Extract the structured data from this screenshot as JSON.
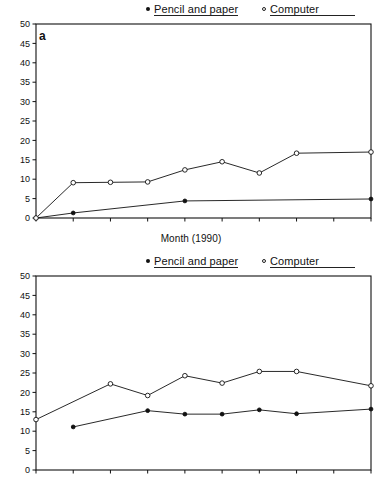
{
  "figure": {
    "legend": {
      "pencil_label": "Pencil and paper",
      "computer_label": "Computer",
      "pencil_marker": "filled-circle-icon",
      "computer_marker": "open-circle-icon"
    },
    "panels": [
      {
        "tag": "a",
        "xlabel": "Month (1990)"
      },
      {
        "tag": "b",
        "xlabel": "Month (1990)"
      }
    ]
  },
  "chart_data": [
    {
      "type": "line",
      "panel": "a",
      "title": "",
      "xlabel": "Month (1990)",
      "ylabel": "",
      "categories": [
        "MAR",
        "APR",
        "MAY",
        "JUN",
        "JUL",
        "AUG",
        "SEP",
        "OCT",
        "NOV",
        "DEC"
      ],
      "x_tick_labels": [
        "MAR",
        "APR",
        "MAY",
        "JUN",
        "JUL",
        "AUG",
        "SEP",
        "OCT",
        "NOV",
        "DEC"
      ],
      "y_tick_labels": [
        "0",
        "5",
        "10",
        "15",
        "20",
        "25",
        "30",
        "35",
        "40",
        "45",
        "50"
      ],
      "ylim": [
        0,
        50
      ],
      "y_ticks": [
        0,
        5,
        10,
        15,
        20,
        25,
        30,
        35,
        40,
        45,
        50
      ],
      "grid": false,
      "legend_position": "top",
      "series": [
        {
          "name": "Pencil and paper",
          "marker": "filled-circle",
          "values": [
            0,
            1.3,
            null,
            null,
            4.4,
            null,
            null,
            null,
            null,
            4.9
          ],
          "points": [
            {
              "x": "MAR",
              "y": 0
            },
            {
              "x": "APR",
              "y": 1.3
            },
            {
              "x": "JUL",
              "y": 4.4
            },
            {
              "x": "DEC",
              "y": 4.9
            }
          ]
        },
        {
          "name": "Computer",
          "marker": "open-circle",
          "values": [
            0,
            9.1,
            9.2,
            9.3,
            12.4,
            14.5,
            11.6,
            16.7,
            null,
            17.0
          ],
          "points": [
            {
              "x": "MAR",
              "y": 0
            },
            {
              "x": "APR",
              "y": 9.1
            },
            {
              "x": "MAY",
              "y": 9.2
            },
            {
              "x": "JUN",
              "y": 9.3
            },
            {
              "x": "JUL",
              "y": 12.4
            },
            {
              "x": "AUG",
              "y": 14.5
            },
            {
              "x": "SEP",
              "y": 11.6
            },
            {
              "x": "OCT",
              "y": 16.7
            },
            {
              "x": "DEC",
              "y": 17.0
            }
          ]
        }
      ]
    },
    {
      "type": "line",
      "panel": "b",
      "title": "",
      "xlabel": "Month (1990)",
      "ylabel": "",
      "categories": [
        "MAR",
        "APR",
        "MAY",
        "JUN",
        "JUL",
        "AUG",
        "SEP",
        "OCT",
        "NOV",
        "DEC"
      ],
      "x_tick_labels": [
        "MAR",
        "APR",
        "MAY",
        "JUN",
        "JUL",
        "AUG",
        "SEP",
        "OCT",
        "NOV",
        "DEC"
      ],
      "y_tick_labels": [
        "0",
        "5",
        "10",
        "15",
        "20",
        "25",
        "30",
        "35",
        "40",
        "45",
        "50"
      ],
      "ylim": [
        0,
        50
      ],
      "y_ticks": [
        0,
        5,
        10,
        15,
        20,
        25,
        30,
        35,
        40,
        45,
        50
      ],
      "grid": false,
      "legend_position": "top",
      "series": [
        {
          "name": "Pencil and paper",
          "marker": "filled-circle",
          "values": [
            null,
            11.1,
            null,
            15.3,
            14.4,
            14.4,
            15.5,
            14.5,
            null,
            15.7
          ],
          "points": [
            {
              "x": "APR",
              "y": 11.1
            },
            {
              "x": "JUN",
              "y": 15.3
            },
            {
              "x": "JUL",
              "y": 14.4
            },
            {
              "x": "AUG",
              "y": 14.4
            },
            {
              "x": "SEP",
              "y": 15.5
            },
            {
              "x": "OCT",
              "y": 14.5
            },
            {
              "x": "DEC",
              "y": 15.7
            }
          ]
        },
        {
          "name": "Computer",
          "marker": "open-circle",
          "values": [
            13.0,
            null,
            22.2,
            19.2,
            24.3,
            22.4,
            25.4,
            25.4,
            null,
            21.7
          ],
          "points": [
            {
              "x": "MAR",
              "y": 13.0
            },
            {
              "x": "MAY",
              "y": 22.2
            },
            {
              "x": "JUN",
              "y": 19.2
            },
            {
              "x": "JUL",
              "y": 24.3
            },
            {
              "x": "AUG",
              "y": 22.4
            },
            {
              "x": "SEP",
              "y": 25.4
            },
            {
              "x": "OCT",
              "y": 25.4
            },
            {
              "x": "DEC",
              "y": 21.7
            }
          ]
        }
      ]
    }
  ]
}
